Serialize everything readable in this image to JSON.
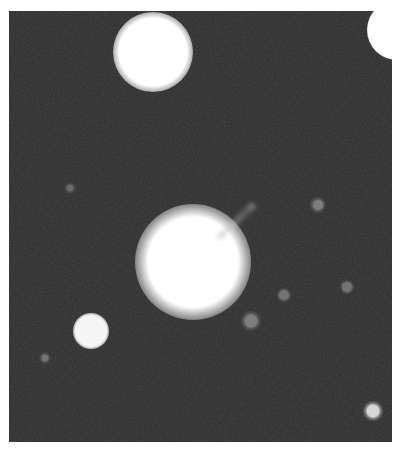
{
  "image": {
    "kind": "astronomical photograph",
    "tone": "grayscale",
    "border_color": "#ffffff",
    "background_color": "#2b2b2b",
    "star_color": "#ffffff"
  },
  "objects": [
    {
      "name": "bright-star-top-left",
      "x": 153,
      "y": 52,
      "core_r": 24,
      "halo_r": 40,
      "brightness": 1.0
    },
    {
      "name": "bright-star-top-right-edge",
      "x": 397,
      "y": 30,
      "core_r": 20,
      "halo_r": 30,
      "brightness": 1.0
    },
    {
      "name": "galaxy-core-center",
      "x": 193,
      "y": 262,
      "core_r": 32,
      "halo_r": 58,
      "brightness": 1.0
    },
    {
      "name": "small-star-left",
      "x": 91,
      "y": 331,
      "core_r": 11,
      "halo_r": 18,
      "brightness": 0.95
    },
    {
      "name": "small-star-bottom-right",
      "x": 373,
      "y": 411,
      "core_r": 4,
      "halo_r": 10,
      "brightness": 0.8
    },
    {
      "name": "faint-blob-1",
      "x": 318,
      "y": 205,
      "core_r": 3,
      "halo_r": 8,
      "brightness": 0.35
    },
    {
      "name": "faint-blob-2",
      "x": 284,
      "y": 295,
      "core_r": 3,
      "halo_r": 7,
      "brightness": 0.3
    },
    {
      "name": "faint-blob-3",
      "x": 251,
      "y": 321,
      "core_r": 4,
      "halo_r": 10,
      "brightness": 0.35
    },
    {
      "name": "faint-blob-4",
      "x": 347,
      "y": 287,
      "core_r": 3,
      "halo_r": 7,
      "brightness": 0.3
    },
    {
      "name": "faint-blob-5",
      "x": 45,
      "y": 358,
      "core_r": 2,
      "halo_r": 6,
      "brightness": 0.3
    },
    {
      "name": "faint-blob-6",
      "x": 70,
      "y": 188,
      "core_r": 2,
      "halo_r": 6,
      "brightness": 0.25
    }
  ],
  "jet": {
    "name": "jet-feature",
    "x1": 218,
    "y1": 238,
    "x2": 254,
    "y2": 204,
    "width": 7
  }
}
